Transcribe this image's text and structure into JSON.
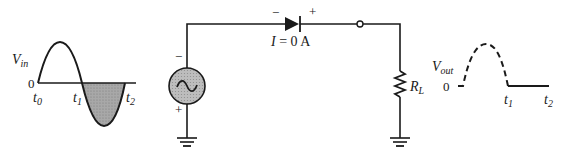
{
  "colors": {
    "ink": "#1a1a1a",
    "shade": "#9a9a9a",
    "source_fill": "#b4b4b4",
    "background": "#ffffff"
  },
  "input_waveform": {
    "label_main": "V",
    "label_sub": "in",
    "zero_label": "0",
    "t0_main": "t",
    "t0_sub": "0",
    "t1_main": "t",
    "t1_sub": "1",
    "t2_main": "t",
    "t2_sub": "2",
    "description": "Full sine cycle; negative half (t1 to t2) shaded"
  },
  "source": {
    "icon": "ac-source-icon",
    "top_polarity": "−",
    "bottom_polarity": "+"
  },
  "diode": {
    "left_polarity": "−",
    "right_polarity": "+",
    "current_label": "I = 0 A",
    "current_main": "I",
    "current_rest": " = 0 A"
  },
  "resistor": {
    "label_main": "R",
    "label_sub": "L"
  },
  "output_waveform": {
    "label_main": "V",
    "label_sub": "out",
    "zero_label": "0",
    "t1_main": "t",
    "t1_sub": "1",
    "t2_main": "t",
    "t2_sub": "2",
    "description": "Dashed positive half (not present), solid zero from t1 to t2"
  }
}
